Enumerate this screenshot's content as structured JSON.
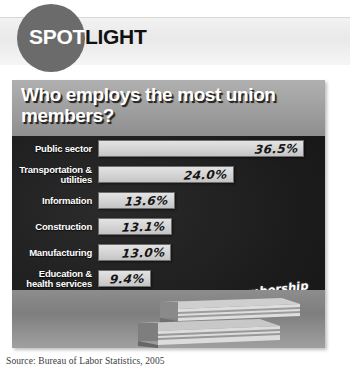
{
  "header": {
    "brand_prefix": "SPOT",
    "brand_suffix": "LIGHT"
  },
  "chart_data": {
    "type": "bar",
    "orientation": "horizontal",
    "title": "Who employs the most union members?",
    "xlabel": "",
    "ylabel": "",
    "xlim": [
      0,
      40
    ],
    "grid": false,
    "legend": null,
    "categories": [
      "Public sector",
      "Transportation & utilities",
      "Information",
      "Construction",
      "Manufacturing",
      "Education & health services",
      "Mining",
      "Wholesale & retail sales"
    ],
    "values": [
      36.5,
      24.0,
      13.6,
      13.1,
      13.0,
      9.4,
      8.5,
      5.9
    ],
    "value_labels": [
      "36.5%",
      "24.0%",
      "13.6%",
      "13.1%",
      "13.0%",
      "9.4%",
      "8.5%",
      "5.9%"
    ],
    "annotation": "Union membership in 2005 was highest in the public sector.",
    "source": "Source: Bureau of Labor Statistics, 2005",
    "colors": {
      "board": "#1d1d1d",
      "bar": "#d6d6d6",
      "title_plate": "#9e9e9e",
      "brand_circle": "#6b6b6b",
      "label_text": "#ffffff",
      "value_text": "#141414"
    }
  },
  "rows": [
    {
      "label_line1": "Public sector",
      "label_line2": "",
      "value": "36.5%",
      "pct": 36.5
    },
    {
      "label_line1": "Transportation &",
      "label_line2": "utilities",
      "value": "24.0%",
      "pct": 24.0
    },
    {
      "label_line1": "Information",
      "label_line2": "",
      "value": "13.6%",
      "pct": 13.6
    },
    {
      "label_line1": "Construction",
      "label_line2": "",
      "value": "13.1%",
      "pct": 13.1
    },
    {
      "label_line1": "Manufacturing",
      "label_line2": "",
      "value": "13.0%",
      "pct": 13.0
    },
    {
      "label_line1": "Education &",
      "label_line2": "health services",
      "value": "9.4%",
      "pct": 9.4
    },
    {
      "label_line1": "Mining",
      "label_line2": "",
      "value": "8.5%",
      "pct": 8.5
    },
    {
      "label_line1": "Wholesale &",
      "label_line2": "retail sales",
      "value": "5.9%",
      "pct": 5.9
    }
  ],
  "annotation": {
    "line1": "Union membership",
    "line2": "in 2005 was",
    "line3": "highest in the",
    "line4": "public sector."
  },
  "footer": {
    "source": "Source: Bureau of Labor Statistics, 2005"
  }
}
